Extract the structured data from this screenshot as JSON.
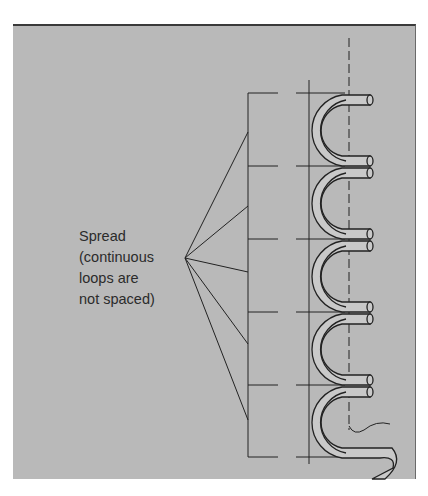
{
  "diagram": {
    "label_lines": [
      "Spread",
      "(continuous",
      "loops are",
      "not spaced)"
    ],
    "colors": {
      "background": "#b9b9b9",
      "line": "#222222",
      "tube_fill": "#c9c9c9"
    },
    "elements": {
      "centerline": "dashed vertical axis",
      "guide_line": "solid vertical line",
      "bracket": "vertical bracket with dashed horizontal ticks",
      "loops_count": 5,
      "fan_lines_count": 5
    }
  }
}
